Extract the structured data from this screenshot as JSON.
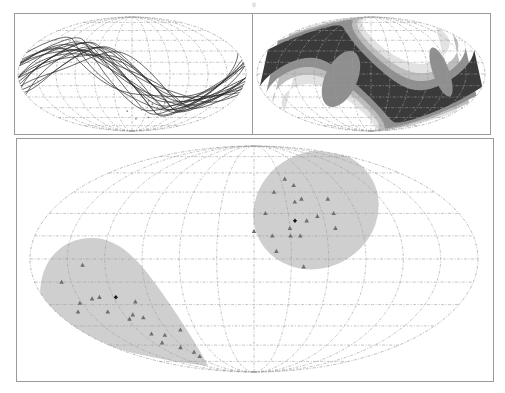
{
  "figure": {
    "page_mark": "g",
    "colors": {
      "background": "#ffffff",
      "frame": "#9a9a9a",
      "grid": "#9c9c9c",
      "tracks": "#2a2a2a",
      "shade_region": "#cfcfcf",
      "markers": "#6e6e6e",
      "centroid": "#111111",
      "contour_levels": [
        "#ffffff",
        "#e2e2e2",
        "#bdbdbd",
        "#8f8f8f",
        "#3a3a3a"
      ]
    }
  },
  "chart_data": [
    {
      "type": "line",
      "title": "",
      "panel": "top-left",
      "projection": "mollweide",
      "description": "Ensemble of sinusoidal great-circle-like tracks crossing the sky map, with a small cluster of faint points near the lower center",
      "grid": true,
      "n_tracks": 18,
      "tracks_phase_deg_range": [
        -40,
        40
      ],
      "tracks_amplitude_deg_range": [
        35,
        55
      ],
      "points_lonlat": [
        [
          30,
          -35
        ],
        [
          38,
          -40
        ],
        [
          45,
          -30
        ],
        [
          50,
          -45
        ],
        [
          60,
          -38
        ],
        [
          70,
          -50
        ],
        [
          20,
          -48
        ],
        [
          55,
          -55
        ],
        [
          75,
          -35
        ],
        [
          40,
          -60
        ],
        [
          -10,
          -50
        ],
        [
          10,
          -62
        ]
      ]
    },
    {
      "type": "heatmap",
      "title": "",
      "panel": "top-right",
      "projection": "mollweide",
      "description": "Probability-density contour map: dark S-shaped band of highest density with lighter shells, white lobes upper-left and lower-right",
      "grid": true,
      "levels": 5,
      "band_phase_deg": 0,
      "band_amplitude_deg": 45
    },
    {
      "type": "scatter",
      "title": "",
      "panel": "bottom",
      "projection": "mollweide",
      "grid": true,
      "meridian_step_deg": 30,
      "parallel_step_deg": 15,
      "regions": [
        {
          "name": "cluster-1",
          "shape": "teardrop",
          "color": "#cfcfcf",
          "centroid_lonlat": [
            -118,
            -25
          ],
          "points_lonlat": [
            [
              -138,
              -4
            ],
            [
              -158,
              -15
            ],
            [
              -152,
              -29
            ],
            [
              -139,
              -26
            ],
            [
              -132,
              -25
            ],
            [
              -133,
              -35
            ],
            [
              -160,
              -35
            ],
            [
              -118,
              -40
            ],
            [
              -112,
              -37
            ],
            [
              -103,
              -28
            ],
            [
              -104,
              -39
            ],
            [
              -110,
              -51
            ],
            [
              -97,
              -52
            ],
            [
              -110,
              -58
            ],
            [
              -95,
              -62
            ],
            [
              -85,
              -66
            ],
            [
              -86,
              -70
            ],
            [
              -76,
              -48
            ]
          ]
        },
        {
          "name": "cluster-2",
          "shape": "ellipse",
          "color": "#cfcfcf",
          "centroid_lonlat": [
            35,
            25
          ],
          "points_lonlat": [
            [
              35,
              55
            ],
            [
              42,
              50
            ],
            [
              20,
              45
            ],
            [
              45,
              40
            ],
            [
              38,
              38
            ],
            [
              70,
              40
            ],
            [
              10,
              30
            ],
            [
              55,
              28
            ],
            [
              45,
              25
            ],
            [
              30,
              20
            ],
            [
              0,
              18
            ],
            [
              15,
              15
            ],
            [
              30,
              15
            ],
            [
              38,
              15
            ],
            [
              18,
              5
            ],
            [
              68,
              20
            ],
            [
              40,
              -5
            ],
            [
              70,
              30
            ]
          ]
        }
      ]
    }
  ]
}
